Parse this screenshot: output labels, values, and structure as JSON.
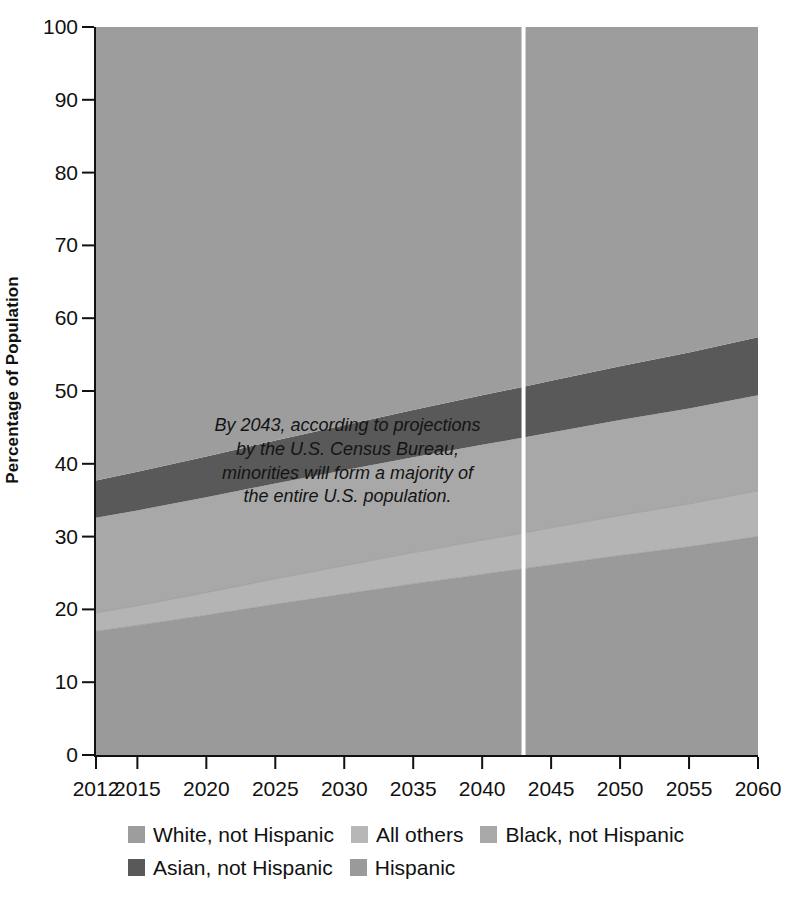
{
  "chart_data": {
    "type": "area",
    "stacked": true,
    "title": "",
    "xlabel": "",
    "ylabel": "Percentage of Population",
    "xlim": [
      2012,
      2060
    ],
    "ylim": [
      0,
      100
    ],
    "grid": false,
    "legend_position": "bottom",
    "x": [
      2012,
      2015,
      2020,
      2025,
      2030,
      2035,
      2040,
      2043,
      2045,
      2050,
      2055,
      2060
    ],
    "y_ticks": [
      0,
      10,
      20,
      30,
      40,
      50,
      60,
      70,
      80,
      90,
      100
    ],
    "x_ticks": [
      2012,
      2015,
      2020,
      2025,
      2030,
      2035,
      2040,
      2045,
      2050,
      2055,
      2060
    ],
    "series": [
      {
        "name": "Hispanic",
        "color": "#9a9a9a",
        "values": [
          17.0,
          17.8,
          19.2,
          20.7,
          22.1,
          23.5,
          24.8,
          25.6,
          26.1,
          27.4,
          28.6,
          30.0
        ]
      },
      {
        "name": "All others",
        "color": "#b4b4b4",
        "values": [
          2.5,
          2.7,
          3.1,
          3.5,
          3.9,
          4.3,
          4.7,
          4.9,
          5.1,
          5.5,
          5.9,
          6.3
        ]
      },
      {
        "name": "Black, not Hispanic",
        "color": "#a8a8a8",
        "values": [
          13.1,
          13.1,
          13.1,
          13.1,
          13.1,
          13.1,
          13.1,
          13.1,
          13.1,
          13.1,
          13.1,
          13.1
        ]
      },
      {
        "name": "Asian, not Hispanic",
        "color": "#595959",
        "values": [
          5.1,
          5.3,
          5.6,
          5.9,
          6.2,
          6.5,
          6.8,
          7.0,
          7.1,
          7.4,
          7.7,
          8.0
        ]
      },
      {
        "name": "White, not Hispanic",
        "color": "#9d9d9d",
        "values": [
          62.3,
          61.1,
          59.0,
          56.8,
          54.7,
          52.6,
          50.6,
          49.4,
          48.6,
          46.6,
          44.7,
          42.6
        ]
      }
    ],
    "marker_line": {
      "year": 2043,
      "color": "#ffffff",
      "label": ""
    },
    "annotation": "By 2043, according to projections\nby the U.S. Census Bureau,\nminorities will form a majority of\nthe entire U.S. population."
  },
  "legend": {
    "rows": [
      [
        {
          "label": "White, not Hispanic",
          "color": "#9d9d9d"
        },
        {
          "label": "All others",
          "color": "#b7b7b7"
        },
        {
          "label": "Black, not Hispanic",
          "color": "#a8a8a8"
        }
      ],
      [
        {
          "label": "Asian, not Hispanic",
          "color": "#595959"
        },
        {
          "label": "Hispanic",
          "color": "#9a9a9a"
        }
      ]
    ]
  },
  "axes": {
    "y_label": "Percentage of Population",
    "y_tick_labels": [
      "0",
      "10",
      "20",
      "30",
      "40",
      "50",
      "60",
      "70",
      "80",
      "90",
      "100"
    ],
    "x_tick_labels": [
      "2012",
      "2015",
      "2020",
      "2025",
      "2030",
      "2035",
      "2040",
      "2045",
      "2050",
      "2055",
      "2060"
    ]
  }
}
